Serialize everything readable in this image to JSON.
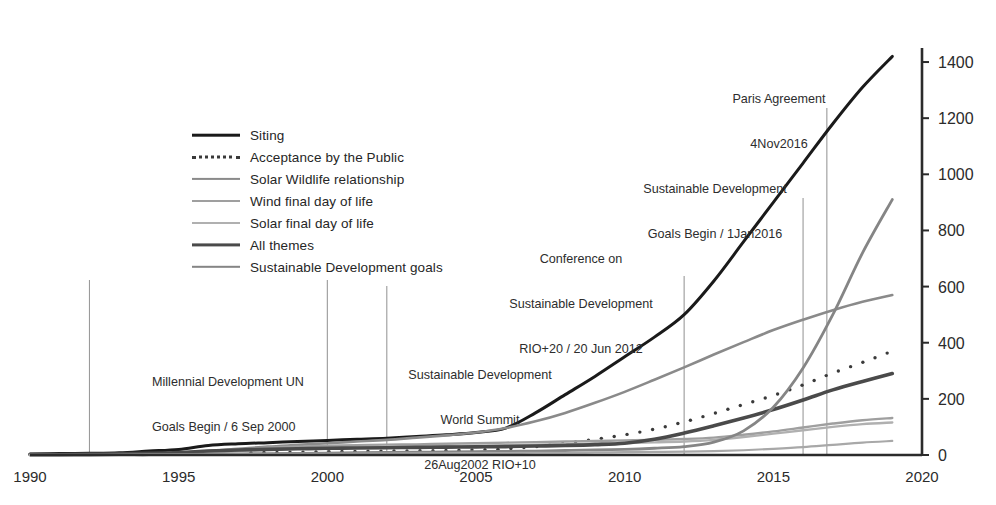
{
  "chart_data": {
    "type": "line",
    "title": "",
    "subtitle": "",
    "xlabel": "",
    "ylabel": "",
    "xlim": [
      1990,
      2020
    ],
    "ylim": [
      0,
      1450
    ],
    "xticks": [
      "1990",
      "1995",
      "2000",
      "2005",
      "2010",
      "2015",
      "2020"
    ],
    "yticks": [
      "0",
      "200",
      "400",
      "600",
      "800",
      "1000",
      "1200",
      "1400"
    ],
    "grid": "vertical-event-lines-only",
    "legend_position": "upper-left-inside",
    "x": [
      1990,
      1991,
      1992,
      1993,
      1994,
      1995,
      1996,
      1997,
      1998,
      1999,
      2000,
      2001,
      2002,
      2003,
      2004,
      2005,
      2006,
      2007,
      2008,
      2009,
      2010,
      2011,
      2012,
      2013,
      2014,
      2015,
      2016,
      2017,
      2018,
      2019
    ],
    "series": [
      {
        "name": "Siting",
        "style": "solid",
        "color": "#1a1a1a",
        "width": 3.0,
        "values": [
          4,
          5,
          6,
          8,
          14,
          20,
          34,
          40,
          44,
          48,
          52,
          56,
          60,
          66,
          72,
          80,
          96,
          150,
          215,
          280,
          350,
          420,
          500,
          620,
          760,
          900,
          1040,
          1180,
          1310,
          1420
        ]
      },
      {
        "name": "Acceptance by the Public",
        "style": "dotted",
        "color": "#3a3a3a",
        "width": 3.4,
        "values": [
          2,
          2,
          3,
          3,
          4,
          5,
          7,
          8,
          9,
          10,
          12,
          13,
          14,
          15,
          16,
          18,
          22,
          30,
          42,
          56,
          72,
          92,
          118,
          148,
          180,
          212,
          250,
          292,
          330,
          370
        ]
      },
      {
        "name": "Solar Wildlife relationship",
        "style": "solid",
        "color": "#8a8a8a",
        "width": 2.6,
        "values": [
          1,
          1,
          2,
          3,
          5,
          8,
          14,
          22,
          30,
          36,
          42,
          48,
          54,
          62,
          70,
          80,
          96,
          120,
          150,
          186,
          225,
          268,
          312,
          358,
          402,
          445,
          482,
          516,
          546,
          570
        ]
      },
      {
        "name": "Wind final day of life",
        "style": "solid",
        "color": "#9f9f9f",
        "width": 2.4,
        "values": [
          1,
          1,
          2,
          3,
          5,
          8,
          14,
          20,
          26,
          30,
          33,
          35,
          37,
          38,
          40,
          42,
          44,
          46,
          48,
          50,
          52,
          54,
          57,
          62,
          72,
          84,
          98,
          112,
          124,
          132
        ]
      },
      {
        "name": "Solar final day of life",
        "style": "solid",
        "color": "#b0b0b0",
        "width": 2.4,
        "values": [
          1,
          1,
          1,
          2,
          3,
          5,
          9,
          14,
          19,
          23,
          26,
          28,
          30,
          31,
          32,
          33,
          35,
          37,
          39,
          41,
          43,
          45,
          48,
          54,
          64,
          76,
          88,
          100,
          110,
          116
        ]
      },
      {
        "name": "All themes",
        "style": "solid",
        "color": "#4a4a4a",
        "width": 3.6,
        "values": [
          2,
          2,
          3,
          4,
          6,
          9,
          14,
          18,
          20,
          22,
          24,
          25,
          26,
          27,
          28,
          29,
          30,
          32,
          34,
          37,
          42,
          56,
          78,
          104,
          132,
          162,
          196,
          232,
          262,
          290
        ]
      },
      {
        "name": "Sustainable Development goals",
        "style": "solid",
        "color": "#858585",
        "width": 2.8,
        "values": [
          0,
          0,
          0,
          1,
          1,
          2,
          3,
          4,
          5,
          6,
          7,
          8,
          9,
          10,
          11,
          12,
          13,
          14,
          16,
          18,
          20,
          24,
          30,
          46,
          86,
          170,
          310,
          500,
          720,
          910
        ]
      },
      {
        "name": "Baseline theme",
        "style": "solid",
        "color": "#a8a8a8",
        "width": 2.2,
        "values": [
          0,
          0,
          0,
          0,
          1,
          1,
          2,
          3,
          3,
          4,
          4,
          5,
          5,
          6,
          6,
          7,
          7,
          8,
          8,
          9,
          10,
          11,
          12,
          14,
          17,
          22,
          28,
          36,
          44,
          50
        ]
      }
    ],
    "event_lines": [
      {
        "x": 1992,
        "label": ""
      },
      {
        "x": 2000,
        "label": "Millennial Development UN Goals Begin / 6 Sep 2000"
      },
      {
        "x": 2002,
        "label": "Sustainable Development World Summit 26Aug2002 RIO+10"
      },
      {
        "x": 2012,
        "label": "Conference on Sustainable Development RIO+20 / 20 Jun 2012"
      },
      {
        "x": 2016,
        "label": "Sustainable Development Goals Begin / 1Jan2016"
      },
      {
        "x": 2016.8,
        "label": "Paris Agreement 4Nov2016"
      }
    ],
    "annotations": [
      {
        "id": "millennial",
        "lines": [
          "Millennial Development UN",
          "Goals Begin / 6 Sep 2000"
        ],
        "align": "left"
      },
      {
        "id": "world-summit",
        "lines": [
          "Sustainable Development",
          "World Summit",
          "26Aug2002 RIO+10"
        ],
        "align": "center"
      },
      {
        "id": "rio20",
        "lines": [
          "Conference on",
          "Sustainable Development",
          "RIO+20 / 20 Jun 2012"
        ],
        "align": "center"
      },
      {
        "id": "sdg-begin",
        "lines": [
          "Sustainable Development",
          "Goals Begin / 1Jan2016"
        ],
        "align": "center"
      },
      {
        "id": "paris",
        "lines": [
          "Paris Agreement",
          "4Nov2016"
        ],
        "align": "center"
      }
    ]
  },
  "legend": {
    "items": [
      {
        "label": "Siting"
      },
      {
        "label": "Acceptance by the Public"
      },
      {
        "label": "Solar Wildlife relationship"
      },
      {
        "label": "Wind final day of life"
      },
      {
        "label": "Solar final day of life"
      },
      {
        "label": "All themes"
      },
      {
        "label": "Sustainable Development goals"
      }
    ]
  },
  "annotation_text": {
    "millennial_l1": "Millennial Development UN",
    "millennial_l2": "Goals Begin / 6 Sep 2000",
    "summit_l1": "Sustainable Development",
    "summit_l2": "World Summit",
    "summit_l3": "26Aug2002 RIO+10",
    "rio20_l1": "Conference on",
    "rio20_l2": "Sustainable Development",
    "rio20_l3": "RIO+20 / 20 Jun 2012",
    "sdg_l1": "Sustainable Development",
    "sdg_l2": "Goals Begin / 1Jan2016",
    "paris_l1": "Paris Agreement",
    "paris_l2": "4Nov2016"
  },
  "axes": {
    "x_ticks": [
      "1990",
      "1995",
      "2000",
      "2005",
      "2010",
      "2015",
      "2020"
    ],
    "y_ticks": [
      "0",
      "200",
      "400",
      "600",
      "800",
      "1000",
      "1200",
      "1400"
    ]
  }
}
